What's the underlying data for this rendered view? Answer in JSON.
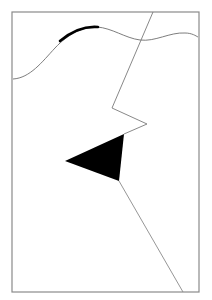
{
  "canvas": {
    "width": 212,
    "height": 300,
    "background": "#ffffff"
  },
  "frame": {
    "x": 12,
    "y": 12,
    "width": 187,
    "height": 280,
    "stroke": "#8a8a8a",
    "stroke_width": 1.2
  },
  "colors": {
    "line": "#7a7a7a",
    "fill": "#000000",
    "wave": "#6e6e6e"
  },
  "shapes": {
    "wave_path": "M13,79 C30,78 42,62 55,48 C68,34 84,26 97,27 C112,28 125,38 140,40 C155,42 170,32 185,33 C192,33 196,36 198,37",
    "wave_thick_path": "M60,41 C72,31 86,26 98,27",
    "zigzag_path": "M153,12 L112,108 L147,124 L124,134",
    "triangle_points": "65,161 124,134 119,181",
    "tail_path": "M119,181 L183,292"
  }
}
